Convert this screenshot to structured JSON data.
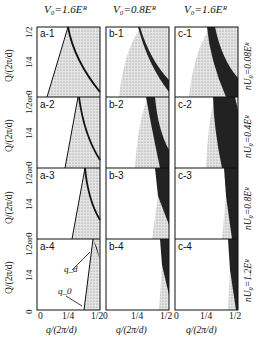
{
  "columns": [
    {
      "id": "a",
      "header": "V₀=1.6Eᴿ"
    },
    {
      "id": "b",
      "header": "V₀=0.8Eᴿ"
    },
    {
      "id": "c",
      "header": "V₀=1.6Eᴿ"
    }
  ],
  "rows": [
    {
      "label": "nU₀=0.08Eᴿ"
    },
    {
      "label": "nU₀=0.4Eᴿ"
    },
    {
      "label": "nU₀=0.8Eᴿ"
    },
    {
      "label": "nU₀=1.2Eᴿ"
    }
  ],
  "panels": [
    [
      "a-1",
      "b-1",
      "c-1"
    ],
    [
      "a-2",
      "b-2",
      "c-2"
    ],
    [
      "a-3",
      "b-3",
      "c-3"
    ],
    [
      "a-4",
      "b-4",
      "c-4"
    ]
  ],
  "axes": {
    "y_label": "Q/(2π/d)",
    "y_ticks_top": [
      "1/2",
      "1/4"
    ],
    "y_ticks_mid": [
      "1/2or0",
      "1/4"
    ],
    "y_tick_bottom": "0",
    "x_label": "q/(2π/d)",
    "x_ticks": [
      "0",
      "1/4",
      "1/2"
    ]
  },
  "annotations": {
    "qd": "q_d",
    "q0": "q_0"
  }
}
